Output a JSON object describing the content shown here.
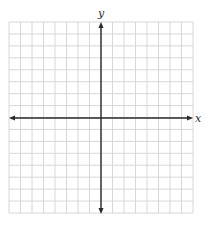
{
  "graph": {
    "type": "coordinate-grid",
    "x_axis_label": "x",
    "y_axis_label": "y",
    "grid": {
      "columns": 16,
      "rows": 16,
      "columns_left_of_y_axis": 8,
      "columns_right_of_y_axis": 8,
      "rows_above_x_axis": 8,
      "rows_below_x_axis": 8,
      "left": 9,
      "top": 22,
      "right": 193,
      "bottom": 213
    },
    "origin": {
      "x": 101,
      "y": 118
    },
    "colors": {
      "grid_line": "#d4d4d4",
      "axis_line": "#2a2a2a",
      "background": "#ffffff"
    }
  }
}
